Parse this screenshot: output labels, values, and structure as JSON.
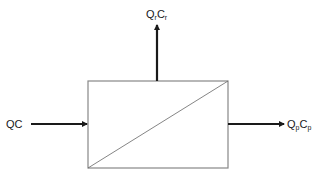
{
  "diagram": {
    "type": "process-block",
    "colors": {
      "line": "#1a1a1a",
      "box_border": "#888888"
    },
    "inlet": {
      "Q": "Q",
      "C": "C",
      "label": "QC"
    },
    "retentate": {
      "Q": "Q",
      "q_sub": "r",
      "C": "C",
      "c_sub": "r",
      "label": "QrCr"
    },
    "permeate": {
      "Q": "Q",
      "q_sub": "p",
      "C": "C",
      "c_sub": "p",
      "label": "QpCp"
    }
  }
}
